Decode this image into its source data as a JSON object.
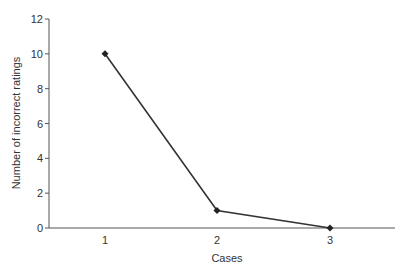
{
  "chart_data": {
    "type": "line",
    "title": "",
    "xlabel": "Cases",
    "ylabel": "Number of incorrect ratings",
    "categories": [
      "1",
      "2",
      "3"
    ],
    "x": [
      1,
      2,
      3
    ],
    "series": [
      {
        "name": "Incorrect ratings",
        "values": [
          10,
          1,
          0
        ],
        "color": "#333333",
        "marker": "diamond"
      }
    ],
    "ylim": [
      0,
      12
    ],
    "yticks": [
      0,
      2,
      4,
      6,
      8,
      10,
      12
    ],
    "grid": false,
    "legend": null
  },
  "axes": {
    "xlabel": "Cases",
    "ylabel": "Number of incorrect ratings",
    "yticks": [
      "0",
      "2",
      "4",
      "6",
      "8",
      "10",
      "12"
    ],
    "xticks": [
      "1",
      "2",
      "3"
    ]
  }
}
